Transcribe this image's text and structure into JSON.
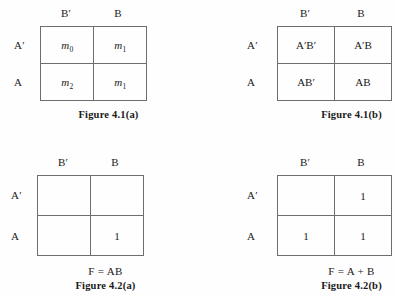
{
  "page": {
    "background_color": "#fefefe",
    "ink_color": "#1a1a1a",
    "border_color": "#6e6e6e"
  },
  "kmaps": [
    {
      "id": "figure-4-1-a",
      "col_headers": [
        "B′",
        "B"
      ],
      "row_headers": [
        "A′",
        "A"
      ],
      "cells": [
        [
          {
            "base": "m",
            "sub": "0",
            "style": "minterm"
          },
          {
            "base": "m",
            "sub": "1",
            "style": "minterm"
          }
        ],
        [
          {
            "base": "m",
            "sub": "2",
            "style": "minterm"
          },
          {
            "base": "m",
            "sub": "1",
            "style": "minterm"
          }
        ]
      ],
      "expression": "",
      "caption": "Figure 4.1(a)"
    },
    {
      "id": "figure-4-1-b",
      "col_headers": [
        "B′",
        "B"
      ],
      "row_headers": [
        "A′",
        "A"
      ],
      "cells": [
        [
          {
            "base": "A′B′",
            "sub": "",
            "style": "plain"
          },
          {
            "base": "A′B",
            "sub": "",
            "style": "plain"
          }
        ],
        [
          {
            "base": "AB′",
            "sub": "",
            "style": "plain"
          },
          {
            "base": "AB",
            "sub": "",
            "style": "plain"
          }
        ]
      ],
      "expression": "",
      "caption": "Figure 4.1(b)"
    },
    {
      "id": "figure-4-2-a",
      "col_headers": [
        "B′",
        "B"
      ],
      "row_headers": [
        "A′",
        "A"
      ],
      "cells": [
        [
          {
            "base": "",
            "sub": "",
            "style": "plain"
          },
          {
            "base": "",
            "sub": "",
            "style": "plain"
          }
        ],
        [
          {
            "base": "",
            "sub": "",
            "style": "plain"
          },
          {
            "base": "1",
            "sub": "",
            "style": "plain"
          }
        ]
      ],
      "expression": "F = AB",
      "caption": "Figure 4.2(a)"
    },
    {
      "id": "figure-4-2-b",
      "col_headers": [
        "B′",
        "B"
      ],
      "row_headers": [
        "A′",
        "A"
      ],
      "cells": [
        [
          {
            "base": "",
            "sub": "",
            "style": "plain"
          },
          {
            "base": "1",
            "sub": "",
            "style": "plain"
          }
        ],
        [
          {
            "base": "1",
            "sub": "",
            "style": "plain"
          },
          {
            "base": "1",
            "sub": "",
            "style": "plain"
          }
        ]
      ],
      "expression": "F = A + B",
      "caption": "Figure 4.2(b)"
    }
  ]
}
